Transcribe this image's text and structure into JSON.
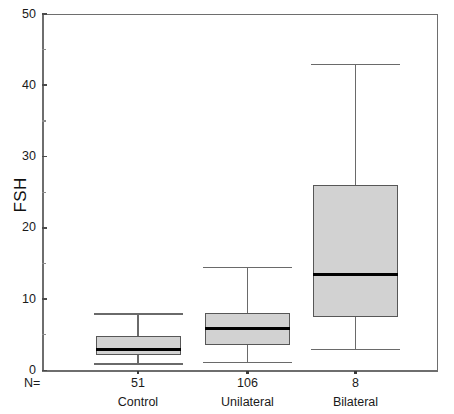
{
  "chart_data": {
    "type": "box",
    "title": "",
    "xlabel": "",
    "ylabel": "FSH",
    "ylim": [
      0,
      50
    ],
    "ytick_values": [
      0,
      10,
      20,
      30,
      40,
      50
    ],
    "ytick_labels": [
      "0",
      "10",
      "20",
      "30",
      "40",
      "50"
    ],
    "yminor_values": [
      5,
      15,
      25,
      35,
      45
    ],
    "grid": false,
    "legend": "none",
    "n_prefix_label": "N=",
    "categories": [
      "Control",
      "Unilateral",
      "Bilateral"
    ],
    "counts": [
      "51",
      "106",
      "8"
    ],
    "boxes": [
      {
        "category": "Control",
        "n": "51",
        "whisker_low": 1.0,
        "q1": 2.2,
        "median": 2.9,
        "q3": 4.8,
        "whisker_high": 8.0
      },
      {
        "category": "Unilateral",
        "n": "106",
        "whisker_low": 1.2,
        "q1": 3.5,
        "median": 5.9,
        "q3": 8.0,
        "whisker_high": 14.5
      },
      {
        "category": "Bilateral",
        "n": "8",
        "whisker_low": 3.0,
        "q1": 7.5,
        "median": 13.5,
        "q3": 26.0,
        "whisker_high": 43.0
      }
    ],
    "colors": {
      "box_fill": "#d2d2d2",
      "box_edge": "#575757",
      "median": "#000000",
      "whisker": "#6a6a6a",
      "axis": "#6e6e6e",
      "background": "#ffffff"
    }
  }
}
